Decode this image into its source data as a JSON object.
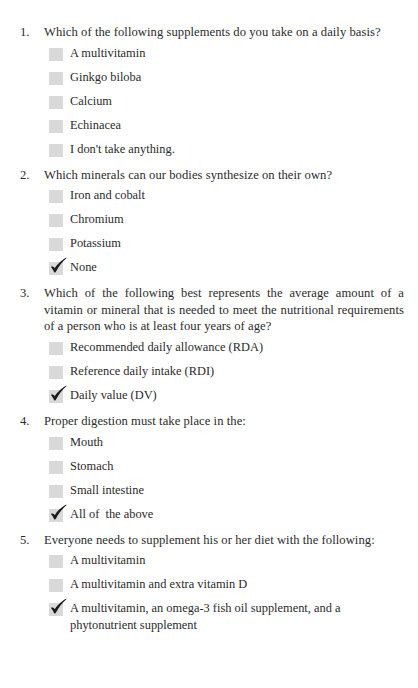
{
  "document": {
    "type": "quiz-worksheet",
    "background_color": "#ffffff",
    "text_color": "#2b2b2b",
    "checkbox_color": "#d9d9d9",
    "checkmark_color": "#1a1a1a"
  },
  "questions": [
    {
      "number": "1.",
      "text": "Which of the following supplements do you take on a daily basis?",
      "options": [
        {
          "label": "A multivitamin",
          "checked": false
        },
        {
          "label": "Ginkgo biloba",
          "checked": false
        },
        {
          "label": "Calcium",
          "checked": false
        },
        {
          "label": "Echinacea",
          "checked": false
        },
        {
          "label": "I don't take anything.",
          "checked": false
        }
      ]
    },
    {
      "number": "2.",
      "text": "Which minerals can our bodies synthesize on their own?",
      "options": [
        {
          "label": "Iron and cobalt",
          "checked": false
        },
        {
          "label": "Chromium",
          "checked": false
        },
        {
          "label": "Potassium",
          "checked": false
        },
        {
          "label": "None",
          "checked": true
        }
      ]
    },
    {
      "number": "3.",
      "text": "Which of the following best represents the average amount of a vitamin or mineral that is needed to meet the nutritional requirements of a person who is at least four years of age?",
      "options": [
        {
          "label": "Recommended daily allowance (RDA)",
          "checked": false
        },
        {
          "label": "Reference daily intake (RDI)",
          "checked": false
        },
        {
          "label": "Daily value (DV)",
          "checked": true
        }
      ]
    },
    {
      "number": "4.",
      "text": "Proper digestion must take place in the:",
      "options": [
        {
          "label": "Mouth",
          "checked": false
        },
        {
          "label": "Stomach",
          "checked": false
        },
        {
          "label": "Small intestine",
          "checked": false
        },
        {
          "label": "All of  the above",
          "checked": true
        }
      ]
    },
    {
      "number": "5.",
      "text": "Everyone needs to supplement his or her diet with the following:",
      "options": [
        {
          "label": "A multivitamin",
          "checked": false
        },
        {
          "label": "A multivitamin and extra vitamin D",
          "checked": false
        },
        {
          "label": "A multivitamin, an omega-3 fish oil supplement, and a phytonutrient supplement",
          "checked": true
        }
      ]
    }
  ]
}
